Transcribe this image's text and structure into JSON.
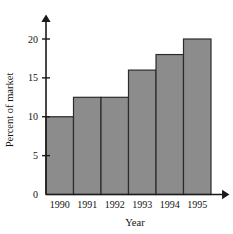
{
  "chart_data": {
    "type": "bar",
    "title": "",
    "categories": [
      "1990",
      "1991",
      "1992",
      "1993",
      "1994",
      "1995"
    ],
    "values": [
      10,
      12.5,
      12.5,
      16,
      18,
      20
    ],
    "xlabel": "Year",
    "ylabel": "Percent of market",
    "ylim": [
      0,
      22.5
    ],
    "yticks": [
      0,
      5,
      10,
      15,
      20
    ],
    "ytick_labels": [
      "0",
      "5",
      "10",
      "15",
      "20"
    ],
    "grid": false,
    "legend": false,
    "bar_fill_color": "#8c8c8c",
    "bar_edge_color": "#2b2b2b",
    "axis_color": "#1a1a1a",
    "background_color": "#ffffff",
    "bars_adjacent": true,
    "x_axis_arrow": true,
    "y_axis_arrow": true
  }
}
